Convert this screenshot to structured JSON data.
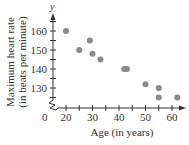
{
  "chart_data": {
    "type": "scatter",
    "title": "",
    "xlabel": "Age (in years)",
    "ylabel": "Maximum heart rate (in beats per minute)",
    "ylabel_line1": "Maximum heart rate",
    "ylabel_line2": "(in beats per minute)",
    "y_axis_variable": "y",
    "origin_label": "0",
    "xlim": [
      0,
      65
    ],
    "ylim": [
      120,
      165
    ],
    "x_ticks": [
      20,
      30,
      40,
      50,
      60
    ],
    "x_tick_labels": [
      "20",
      "30",
      "40",
      "50",
      "60"
    ],
    "y_ticks": [
      130,
      140,
      150,
      160
    ],
    "y_tick_labels": [
      "130",
      "140",
      "150",
      "160"
    ],
    "axis_break": true,
    "grid": false,
    "legend": null,
    "marker_color": "#8a8a8a",
    "series": [
      {
        "name": "Maximum heart rate",
        "points": [
          {
            "x": 20,
            "y": 160
          },
          {
            "x": 25,
            "y": 150
          },
          {
            "x": 29,
            "y": 155
          },
          {
            "x": 30,
            "y": 148
          },
          {
            "x": 33,
            "y": 145
          },
          {
            "x": 42,
            "y": 140
          },
          {
            "x": 43,
            "y": 140
          },
          {
            "x": 50,
            "y": 132
          },
          {
            "x": 55,
            "y": 130
          },
          {
            "x": 55,
            "y": 125
          },
          {
            "x": 62,
            "y": 125
          }
        ]
      }
    ]
  }
}
